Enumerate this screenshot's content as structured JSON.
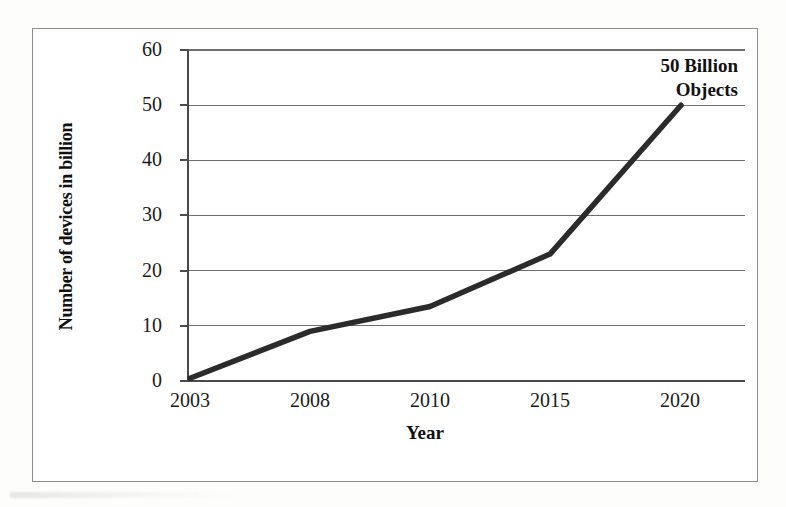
{
  "chart_data": {
    "type": "line",
    "title": "",
    "subtitle": "",
    "xlabel": "Year",
    "ylabel": "Number of devices in billion",
    "categories": [
      "2003",
      "2008",
      "2010",
      "2015",
      "2020"
    ],
    "x_tick_labels": [
      "2003",
      "2008",
      "2010",
      "2015",
      "2020"
    ],
    "y_tick_labels": [
      "0",
      "10",
      "20",
      "30",
      "40",
      "50",
      "60"
    ],
    "y_ticks": [
      0,
      10,
      20,
      30,
      40,
      50,
      60
    ],
    "ylim": [
      0,
      60
    ],
    "grid": "horizontal",
    "legend": "none",
    "series": [
      {
        "name": "Number of devices in billion",
        "values": [
          0.5,
          9,
          13.5,
          23,
          50
        ],
        "color": "#2b2b2b",
        "line_width": 5.5,
        "markers": "none"
      }
    ],
    "annotations": [
      {
        "name": "endpoint-callout",
        "lines": [
          "50 Billion",
          "Objects"
        ],
        "text": "50 Billion Objects",
        "anchor_category": "2020",
        "anchor_value": 50,
        "align": "right"
      }
    ],
    "colors": {
      "line": "#2b2b2b",
      "gridline": "#6f6f6f",
      "axis": "#4a4a4a",
      "frame": "#8d8d8d",
      "text": "#111111",
      "background": "#ffffff"
    }
  },
  "axis": {
    "y_title": "Number of devices in billion",
    "x_title": "Year"
  },
  "annotation": {
    "line1": "50 Billion",
    "line2": "Objects"
  }
}
